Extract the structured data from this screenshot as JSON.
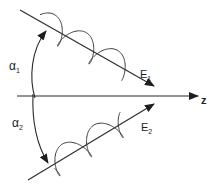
{
  "diagram": {
    "axis": {
      "label": "z",
      "y": 96,
      "x_start": 17,
      "x_end": 198
    },
    "beams": [
      {
        "id": "beam-1",
        "field_label": "E",
        "field_sub": "1",
        "x1": 20,
        "y1": 10,
        "x2": 154,
        "y2": 86,
        "wave_start": 26,
        "wave_end": 120,
        "amp": 13,
        "cycles": 2.6,
        "phase": 3.6,
        "label_x": 140,
        "label_y": 78
      },
      {
        "id": "beam-2",
        "field_label": "E",
        "field_sub": "2",
        "x1": 28,
        "y1": 180,
        "x2": 154,
        "y2": 104,
        "wave_start": 22,
        "wave_end": 118,
        "amp": 13,
        "cycles": 2.6,
        "phase": 0.3,
        "label_x": 141,
        "label_y": 131
      }
    ],
    "angles": [
      {
        "label": "α",
        "sub": "1",
        "label_x": 9,
        "label_y": 70
      },
      {
        "label": "α",
        "sub": "2",
        "label_x": 12,
        "label_y": 127
      }
    ],
    "colors": {
      "line": "#2a2a2a",
      "background": "#ffffff"
    }
  }
}
